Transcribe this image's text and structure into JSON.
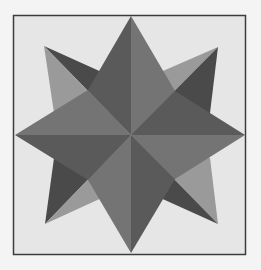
{
  "image": {
    "subject": "eight-pointed compass star quilt block",
    "colors": {
      "background": "#f4f4f4",
      "panel": "#e6e6e6",
      "border": "#3c3c3c",
      "light": "#9a9a9a",
      "medium": "#747474",
      "dark": "#555555",
      "darker": "#4a4a4a"
    }
  }
}
